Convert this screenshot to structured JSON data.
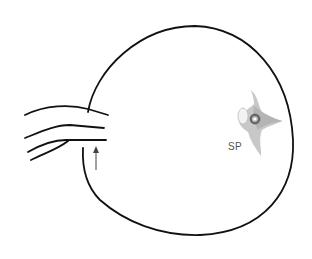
{
  "diagram": {
    "labels": {
      "sp": "SP"
    },
    "colors": {
      "outline": "#111111",
      "structure_light": "#c8c8c8",
      "structure_mid": "#a8a8a8",
      "ring": "#666666",
      "label": "#555555"
    },
    "elements": [
      {
        "id": "outline",
        "description": "rounded sac outline with opening on the left"
      },
      {
        "id": "bands",
        "description": "three curved bands entering from the left"
      },
      {
        "id": "arrow",
        "description": "small upward-pointing arrow below bands"
      },
      {
        "id": "sp-structure",
        "description": "gray star-shaped structure with dark ring, labeled SP"
      }
    ]
  }
}
